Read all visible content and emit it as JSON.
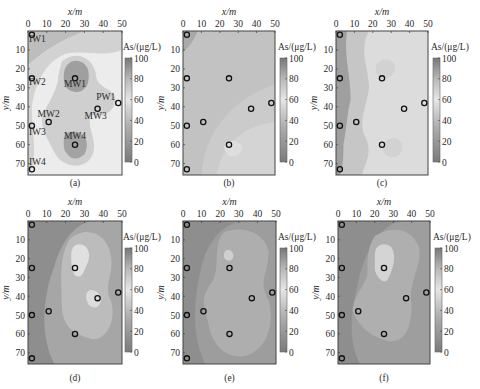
{
  "figure": {
    "x_axis_label": "x/m",
    "y_axis_label": "y/m",
    "colorbar_label": "As/(μg/L)",
    "colorbar_ticks": [
      "0",
      "20",
      "40",
      "60",
      "80",
      "100"
    ],
    "x_ticks": [
      "0",
      "10",
      "20",
      "30",
      "40",
      "50"
    ],
    "y_ticks": [
      "10",
      "20",
      "30",
      "40",
      "50",
      "60",
      "70"
    ]
  },
  "chart_data": [
    {
      "type": "heatmap",
      "panel": "(a)",
      "title": "(a)",
      "xlabel": "x/m",
      "ylabel": "y/m",
      "xlim": [
        0,
        50
      ],
      "ylim": [
        0,
        76
      ],
      "colorbar": {
        "label": "As/(μg/L)",
        "range": [
          0,
          100
        ]
      },
      "wells": [
        {
          "name": "IW1",
          "x": 1,
          "y": 2
        },
        {
          "name": "IW2",
          "x": 1,
          "y": 25
        },
        {
          "name": "MW1",
          "x": 25,
          "y": 25
        },
        {
          "name": "PW1",
          "x": 48,
          "y": 38
        },
        {
          "name": "MW3",
          "x": 37,
          "y": 41
        },
        {
          "name": "MW2",
          "x": 11,
          "y": 48
        },
        {
          "name": "IW3",
          "x": 1,
          "y": 50
        },
        {
          "name": "MW4",
          "x": 25,
          "y": 60
        },
        {
          "name": "IW4",
          "x": 1,
          "y": 73
        }
      ],
      "contour_levels": [
        {
          "level": 40,
          "note": "high-value area"
        },
        {
          "level": 30
        },
        {
          "level": 20
        },
        {
          "level": 10
        }
      ]
    },
    {
      "type": "heatmap",
      "panel": "(b)",
      "title": "(b)",
      "xlabel": "x/m",
      "ylabel": "y/m",
      "xlim": [
        0,
        50
      ],
      "ylim": [
        0,
        76
      ],
      "colorbar": {
        "label": "As/(μg/L)",
        "range": [
          0,
          100
        ]
      }
    },
    {
      "type": "heatmap",
      "panel": "(c)",
      "title": "(c)",
      "xlabel": "x/m",
      "ylabel": "y/m",
      "xlim": [
        0,
        50
      ],
      "ylim": [
        0,
        76
      ],
      "colorbar": {
        "label": "As/(μg/L)",
        "range": [
          0,
          100
        ]
      }
    },
    {
      "type": "heatmap",
      "panel": "(d)",
      "title": "(d)",
      "xlabel": "x/m",
      "ylabel": "y/m",
      "xlim": [
        0,
        50
      ],
      "ylim": [
        0,
        76
      ],
      "colorbar": {
        "label": "As/(μg/L)",
        "range": [
          0,
          100
        ]
      }
    },
    {
      "type": "heatmap",
      "panel": "(e)",
      "title": "(e)",
      "xlabel": "x/m",
      "ylabel": "y/m",
      "xlim": [
        0,
        50
      ],
      "ylim": [
        0,
        76
      ],
      "colorbar": {
        "label": "As/(μg/L)",
        "range": [
          0,
          100
        ]
      }
    },
    {
      "type": "heatmap",
      "panel": "(f)",
      "title": "(f)",
      "xlabel": "x/m",
      "ylabel": "y/m",
      "xlim": [
        0,
        50
      ],
      "ylim": [
        0,
        76
      ],
      "colorbar": {
        "label": "As/(μg/L)",
        "range": [
          0,
          100
        ]
      }
    }
  ]
}
